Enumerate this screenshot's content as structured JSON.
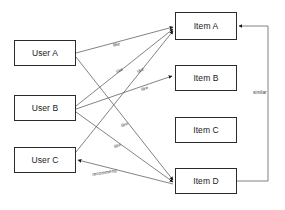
{
  "diagram": {
    "background_color": "#ffffff",
    "stroke_color": "#555555",
    "node_border_color": "#2b2b2b"
  },
  "nodes": {
    "users": [
      {
        "id": "user-a",
        "label": "User A",
        "x": 14,
        "y": 40,
        "w": 62,
        "h": 26
      },
      {
        "id": "user-b",
        "label": "User B",
        "x": 14,
        "y": 95,
        "w": 62,
        "h": 26
      },
      {
        "id": "user-c",
        "label": "User C",
        "x": 14,
        "y": 147,
        "w": 62,
        "h": 26
      }
    ],
    "items": [
      {
        "id": "item-a",
        "label": "Item A",
        "x": 175,
        "y": 12,
        "w": 62,
        "h": 28
      },
      {
        "id": "item-b",
        "label": "Item B",
        "x": 175,
        "y": 65,
        "w": 62,
        "h": 26
      },
      {
        "id": "item-c",
        "label": "Item C",
        "x": 175,
        "y": 117,
        "w": 62,
        "h": 26
      },
      {
        "id": "item-d",
        "label": "Item D",
        "x": 175,
        "y": 168,
        "w": 62,
        "h": 26
      }
    ]
  },
  "edges": [
    {
      "id": "edge-user-a-item-a",
      "from": "User A",
      "to": "Item A",
      "label": "like"
    },
    {
      "id": "edge-user-a-item-d",
      "from": "User A",
      "to": "Item D",
      "label": "like"
    },
    {
      "id": "edge-user-b-item-a",
      "from": "User B",
      "to": "Item A",
      "label": "like"
    },
    {
      "id": "edge-user-b-item-b",
      "from": "User B",
      "to": "Item B",
      "label": "like"
    },
    {
      "id": "edge-user-b-item-d",
      "from": "User B",
      "to": "Item D",
      "label": "like"
    },
    {
      "id": "edge-user-c-item-a",
      "from": "User C",
      "to": "Item A",
      "label": "like"
    },
    {
      "id": "edge-item-d-user-c",
      "from": "Item D",
      "to": "User C",
      "label": "recommend"
    },
    {
      "id": "edge-item-d-item-a",
      "from": "Item D",
      "to": "Item A",
      "label": "similar"
    }
  ],
  "edge_labels": [
    {
      "id": "label-like-1",
      "text": "like",
      "x": 113,
      "y": 42
    },
    {
      "id": "label-like-2",
      "text": "like",
      "x": 116,
      "y": 68
    },
    {
      "id": "label-like-3",
      "text": "like",
      "x": 137,
      "y": 68
    },
    {
      "id": "label-like-4",
      "text": "like",
      "x": 141,
      "y": 86
    },
    {
      "id": "label-like-5",
      "text": "like",
      "x": 121,
      "y": 122
    },
    {
      "id": "label-like-6",
      "text": "like",
      "x": 114,
      "y": 143
    },
    {
      "id": "label-recommend",
      "text": "recommend",
      "x": 92,
      "y": 170
    },
    {
      "id": "label-similar",
      "text": "similar",
      "x": 253,
      "y": 90
    }
  ]
}
